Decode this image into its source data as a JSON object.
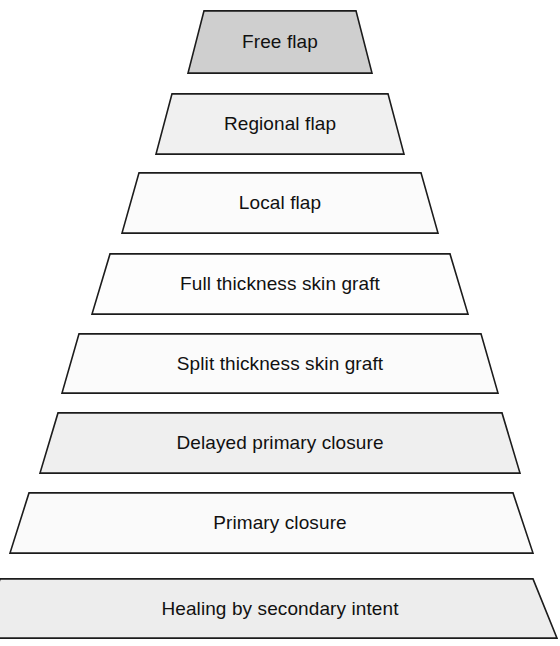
{
  "diagram": {
    "type": "pyramid",
    "orientation": "apex-top",
    "levels_count": 8,
    "background_color": "#ffffff",
    "outline_color": "#1c1c1c",
    "text_color": "#111111",
    "levels": [
      {
        "rank": 1,
        "label": "Free flap",
        "fill": "#cfcfcf",
        "top_y": 10,
        "bottom_y": 74,
        "top_left_x": 204,
        "top_right_x": 356,
        "bottom_left_x": 188,
        "bottom_right_x": 372
      },
      {
        "rank": 2,
        "label": "Regional flap",
        "fill": "#f0f0f0",
        "top_y": 93,
        "bottom_y": 155,
        "top_left_x": 172,
        "top_right_x": 388,
        "bottom_left_x": 156,
        "bottom_right_x": 404
      },
      {
        "rank": 3,
        "label": "Local flap",
        "fill": "#fbfbfb",
        "top_y": 172,
        "bottom_y": 234,
        "top_left_x": 139,
        "top_right_x": 421,
        "bottom_left_x": 122,
        "bottom_right_x": 438
      },
      {
        "rank": 4,
        "label": "Full thickness skin graft",
        "fill": "#fdfdfd",
        "top_y": 253,
        "bottom_y": 315,
        "top_left_x": 110,
        "top_right_x": 450,
        "bottom_left_x": 92,
        "bottom_right_x": 468
      },
      {
        "rank": 5,
        "label": "Split thickness skin graft",
        "fill": "#fbfbfb",
        "top_y": 333,
        "bottom_y": 394,
        "top_left_x": 79,
        "top_right_x": 481,
        "bottom_left_x": 62,
        "bottom_right_x": 498
      },
      {
        "rank": 6,
        "label": "Delayed primary closure",
        "fill": "#efefef",
        "top_y": 412,
        "bottom_y": 474,
        "top_left_x": 58,
        "top_right_x": 502,
        "bottom_left_x": 40,
        "bottom_right_x": 520
      },
      {
        "rank": 7,
        "label": "Primary closure",
        "fill": "#fafafa",
        "top_y": 492,
        "bottom_y": 554,
        "top_left_x": 29,
        "top_right_x": 513,
        "bottom_left_x": 10,
        "bottom_right_x": 533
      },
      {
        "rank": 8,
        "label": "Healing by secondary intent",
        "fill": "#ededed",
        "top_y": 578,
        "bottom_y": 639,
        "top_left_x": 0,
        "top_right_x": 533,
        "bottom_left_x": -18,
        "bottom_right_x": 557
      }
    ]
  }
}
